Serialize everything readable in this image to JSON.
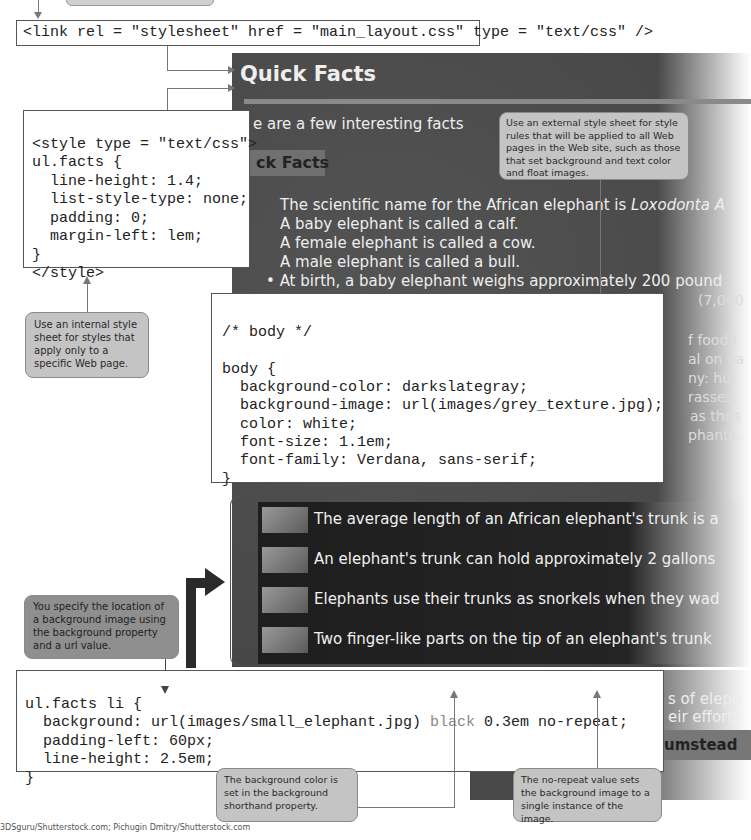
{
  "link_code": "<link rel = \"stylesheet\" href = \"main_layout.css\" type = \"text/css\" />",
  "internal_style_code": {
    "lines": [
      "<style type = \"text/css\">",
      "ul.facts {",
      "  line-height: 1.4;",
      "  list-style-type: none;",
      "  padding: 0;",
      "  margin-left: lem;",
      "}",
      "</style>"
    ]
  },
  "body_css_code": {
    "lines": [
      "/* body */",
      "",
      "body {",
      "  background-color: darkslategray;",
      "  background-image: url(images/grey_texture.jpg);",
      "  color: white;",
      "  font-size: 1.1em;",
      "  font-family: Verdana, sans-serif;",
      "}"
    ]
  },
  "li_css_code": {
    "line1": "ul.facts li {",
    "line2_prefix": "  background: url(images/small_elephant.jpg) ",
    "line2_black": "black",
    "line2_suffix": " 0.3em no-repeat;",
    "line3": "  padding-left: 60px;",
    "line4": "  line-height: 2.5em;",
    "line5": "}"
  },
  "callouts": {
    "external": "Use an external style sheet for style rules that will be applied to all Web pages in the Web site, such as those that set background and text color and float images.",
    "internal": "Use an internal style sheet for styles that apply only to a specific Web page.",
    "background_location": "You specify the location of a background image using the background property and a url value.",
    "background_color": "The background color is set in the background shorthand property.",
    "no_repeat": "The no-repeat value sets the background image to a single instance of the image."
  },
  "screenshot": {
    "title": "Quick Facts",
    "intro": "e are a few interesting facts",
    "subheading": "ck Facts",
    "bullets": [
      "The scientific name for the African elephant is ",
      "A baby elephant is called a calf.",
      "A female elephant is called a cow.",
      "A male elephant is called a bull.",
      "At birth, a baby elephant weighs approximately 200 pound"
    ],
    "bullet1_italic": "Loxodonta A",
    "partial_right": [
      "(7,000",
      "f food i",
      "al on ea",
      "ny: hur",
      "rasses,",
      "as thos",
      "phants."
    ],
    "facts": [
      "The average length of an African elephant's trunk is a",
      "An elephant's trunk can hold approximately 2 gallons",
      "Elephants use their trunks as snorkels when they wad",
      "Two finger-like parts on the tip of an elephant's trunk"
    ],
    "bottom_partial": [
      "s of eleph",
      "eir efforts",
      "umstead"
    ]
  },
  "credit": "3DSguru/Shutterstock.com; Pichugin Dmitry/Shutterstock.com"
}
